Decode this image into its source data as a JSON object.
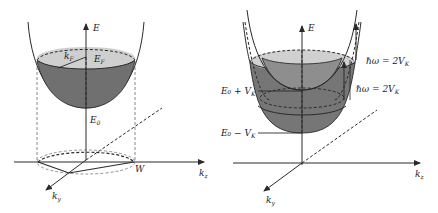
{
  "colors": {
    "background": "#ffffff",
    "line": "#2a2a2a",
    "fill_dark": "#6e6e6e",
    "fill_light": "#c9c9c9",
    "fill_mid": "#8c8c8c"
  },
  "left_panel": {
    "axis_e": "E",
    "axis_kz": "k",
    "axis_kz_sub": "z",
    "axis_ky": "k",
    "axis_ky_sub": "y",
    "fermi_energy": "E",
    "fermi_energy_sub": "F",
    "fermi_wavevector": "k",
    "fermi_wavevector_sub": "F",
    "band_bottom": "E",
    "band_bottom_sub": "0",
    "point_w": "W"
  },
  "right_panel": {
    "axis_e": "E",
    "axis_kz": "k",
    "axis_kz_sub": "z",
    "axis_ky": "k",
    "axis_ky_sub": "y",
    "transition_upper": "ℏω = 2V",
    "transition_upper_sub": "K",
    "transition_lower": "ℏω = 2V",
    "transition_lower_sub": "K",
    "level_upper": "E₀ + V",
    "level_upper_sub": "K",
    "level_lower": "E₀ − V",
    "level_lower_sub": "K"
  }
}
